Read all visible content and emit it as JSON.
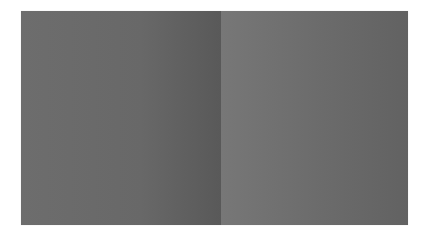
{
  "image": {
    "description": "Two adjacent gray gradient panels on a white background",
    "panels": [
      {
        "name": "left",
        "color_start": "#6d6d6d",
        "color_end": "#595959"
      },
      {
        "name": "right",
        "color_start": "#777777",
        "color_end": "#626262"
      }
    ],
    "background": "#ffffff"
  }
}
